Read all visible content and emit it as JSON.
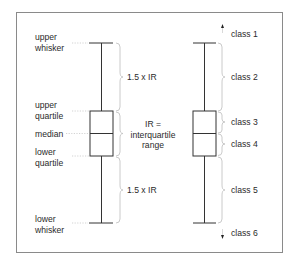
{
  "diagram": {
    "left_plot": {
      "labels": {
        "upper_whisker_1": "upper",
        "upper_whisker_2": "whisker",
        "upper_quartile_1": "upper",
        "upper_quartile_2": "quartile",
        "median": "median",
        "lower_quartile_1": "lower",
        "lower_quartile_2": "quartile",
        "lower_whisker_1": "lower",
        "lower_whisker_2": "whisker"
      },
      "annotations": {
        "upper_range": "1.5 x IR",
        "iqr_1": "IR =",
        "iqr_2": "interquartile",
        "iqr_3": "range",
        "lower_range": "1.5 x IR"
      }
    },
    "right_plot": {
      "classes": [
        "class 1",
        "class 2",
        "class 3",
        "class 4",
        "class 5",
        "class 6"
      ]
    },
    "colors": {
      "line": "#333333",
      "brace": "#c4c4c4",
      "text": "#2a2a2a",
      "frame": "#8a8a8a"
    }
  }
}
